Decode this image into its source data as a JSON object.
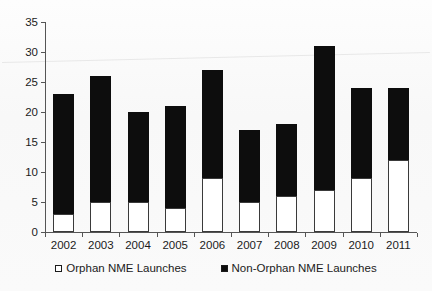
{
  "chart_data": {
    "type": "bar",
    "subtype": "stacked-bar",
    "title": "",
    "xlabel": "",
    "ylabel": "",
    "categories": [
      "2002",
      "2003",
      "2004",
      "2005",
      "2006",
      "2007",
      "2008",
      "2009",
      "2010",
      "2011"
    ],
    "series": [
      {
        "name": "Orphan NME Launches",
        "color": "#ffffff",
        "marker": "hollow-square",
        "values": [
          3,
          5,
          5,
          4,
          9,
          5,
          6,
          7,
          9,
          12
        ]
      },
      {
        "name": "Non-Orphan NME Launches",
        "color": "#0d0d0d",
        "marker": "filled-square",
        "values": [
          20,
          21,
          15,
          17,
          18,
          12,
          12,
          24,
          15,
          12
        ]
      }
    ],
    "totals": [
      23,
      26,
      20,
      21,
      27,
      17,
      18,
      31,
      24,
      24
    ],
    "ylim": [
      0,
      35
    ],
    "ytick_values": [
      0,
      5,
      10,
      15,
      20,
      25,
      30,
      35
    ],
    "ytick_labels": [
      "0",
      "5",
      "10",
      "15",
      "20",
      "25",
      "30",
      "35"
    ],
    "grid": false,
    "legend_position": "bottom-center"
  },
  "legend": {
    "entries": [
      {
        "label": "Orphan NME Launches",
        "swatch": "hollow-square"
      },
      {
        "label": "Non-Orphan NME Launches",
        "swatch": "filled-square"
      }
    ]
  },
  "colors": {
    "orphan": "#ffffff",
    "non_orphan": "#0d0d0d",
    "axis": "#555555",
    "text": "#1b1b1b",
    "background": "#fbfbfb"
  }
}
